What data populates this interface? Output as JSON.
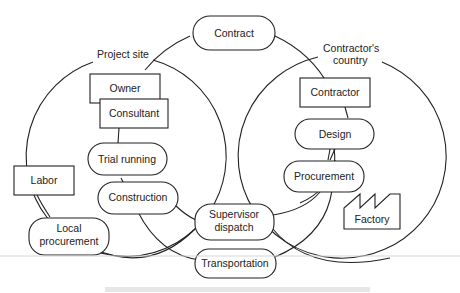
{
  "diagram": {
    "regions": {
      "project_site": "Project site",
      "contractors_country_line1": "Contractor's",
      "contractors_country_line2": "country"
    },
    "nodes": {
      "contract": "Contract",
      "owner": "Owner",
      "consultant": "Consultant",
      "trial_running": "Trial running",
      "construction": "Construction",
      "labor": "Labor",
      "local_procurement_line1": "Local",
      "local_procurement_line2": "procurement",
      "supervisor_dispatch_line1": "Supervisor",
      "supervisor_dispatch_line2": "dispatch",
      "transportation": "Transportation",
      "contractor": "Contractor",
      "design": "Design",
      "procurement": "Procurement",
      "factory": "Factory"
    },
    "shapes": {
      "rectangles": [
        "Owner",
        "Consultant",
        "Labor",
        "Contractor"
      ],
      "rounded": [
        "Contract",
        "Trial running",
        "Construction",
        "Local procurement",
        "Supervisor dispatch",
        "Transportation",
        "Design",
        "Procurement"
      ],
      "factory_icon": "Factory"
    }
  }
}
